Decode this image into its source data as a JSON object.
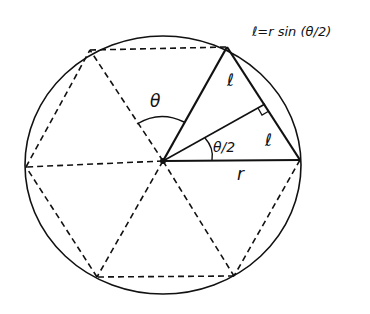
{
  "formula": "ℓ=r sin (θ/2)",
  "labels": {
    "theta": "θ",
    "half_theta": "θ/2",
    "chord_upper": "ℓ",
    "chord_lower": "ℓ",
    "radius": "r"
  },
  "geometry": {
    "center": [
      163,
      161
    ],
    "circle": {
      "cx": 163,
      "cy": 165,
      "rx": 138,
      "ry": 129
    },
    "hexagon_vertices": [
      [
        90,
        50
      ],
      [
        227,
        47
      ],
      [
        300,
        160
      ],
      [
        234,
        276
      ],
      [
        97,
        277
      ],
      [
        26,
        167
      ]
    ],
    "perpendicular_foot": [
      265,
      104
    ]
  },
  "colors": {
    "stroke": "#111111",
    "background": "#ffffff"
  }
}
